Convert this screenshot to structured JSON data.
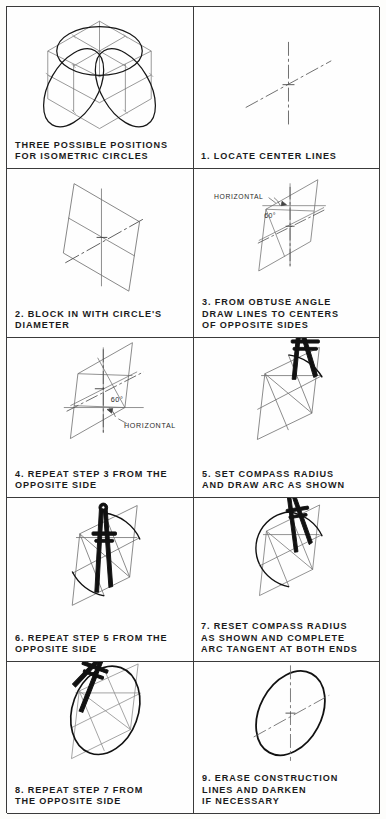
{
  "sheet": {
    "title": "Isometric Circle Construction Steps",
    "columns": 2,
    "rows": 5,
    "ink_color": "#1b1b1b",
    "construction_line_color": "#8a8a8a",
    "border_color": "#3a3a3a",
    "background": "#fefefe"
  },
  "panels": [
    {
      "id": "panel-intro",
      "number": "",
      "caption": "THREE POSSIBLE POSITIONS\nFOR ISOMETRIC CIRCLES",
      "drawing": "isometric-cube-with-three-ellipses",
      "annotations": []
    },
    {
      "id": "panel-1",
      "number": "1",
      "caption": "1. LOCATE CENTER LINES",
      "drawing": "center-lines-cross",
      "annotations": []
    },
    {
      "id": "panel-2",
      "number": "2",
      "caption": "2. BLOCK IN WITH CIRCLE'S\n   DIAMETER",
      "drawing": "isometric-rhombus-with-center-lines",
      "annotations": []
    },
    {
      "id": "panel-3",
      "number": "3",
      "caption": "3. FROM OBTUSE ANGLE\n   DRAW LINES TO CENTERS\n   OF OPPOSITE SIDES",
      "drawing": "rhombus-with-construction-lines-from-top-obtuse-angle",
      "annotations": [
        {
          "label": "HORIZONTAL",
          "type": "leader-label"
        },
        {
          "label": "60°",
          "type": "angle-label"
        }
      ]
    },
    {
      "id": "panel-4",
      "number": "4",
      "caption": "4. REPEAT STEP 3 FROM THE\n   OPPOSITE SIDE",
      "drawing": "rhombus-with-construction-lines-from-bottom-obtuse-angle",
      "annotations": [
        {
          "label": "HORIZONTAL",
          "type": "leader-label"
        },
        {
          "label": "60°",
          "type": "angle-label"
        }
      ]
    },
    {
      "id": "panel-5",
      "number": "5",
      "caption": "5. SET COMPASS RADIUS\n   AND DRAW ARC AS SHOWN",
      "drawing": "compass-drawing-first-large-arc",
      "annotations": []
    },
    {
      "id": "panel-6",
      "number": "6",
      "caption": "6. REPEAT STEP 5 FROM THE\n   OPPOSITE SIDE",
      "drawing": "compass-drawing-second-large-arc",
      "annotations": []
    },
    {
      "id": "panel-7",
      "number": "7",
      "caption": "7. RESET COMPASS RADIUS\nAS SHOWN AND COMPLETE\nARC TANGENT AT BOTH ENDS",
      "drawing": "compass-drawing-small-tangent-arc",
      "annotations": []
    },
    {
      "id": "panel-8",
      "number": "8",
      "caption": "8. REPEAT STEP 7 FROM\n   THE OPPOSITE SIDE",
      "drawing": "compass-completing-ellipse",
      "annotations": []
    },
    {
      "id": "panel-9",
      "number": "9",
      "caption": "9. ERASE CONSTRUCTION\n   LINES AND DARKEN\n   IF NECESSARY",
      "drawing": "finished-isometric-ellipse",
      "annotations": []
    }
  ]
}
